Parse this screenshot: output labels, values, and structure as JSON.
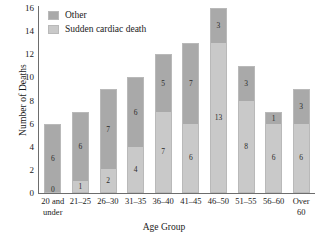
{
  "chart_data": {
    "type": "bar",
    "subtype": "stacked-bar",
    "title": "",
    "xlabel": "Age Group",
    "ylabel": "Number of Deaths",
    "ylim": [
      0,
      16
    ],
    "yticks": [
      0,
      2,
      4,
      6,
      8,
      10,
      12,
      14,
      16
    ],
    "ytick_labels": [
      "0",
      "2",
      "4",
      "6",
      "8",
      "10",
      "12",
      "14",
      "16"
    ],
    "grid": false,
    "legend_position": "top-left-inside",
    "categories": [
      "20 and\nunder",
      "21–25",
      "26–30",
      "31–35",
      "36–40",
      "41–45",
      "46–50",
      "51–55",
      "56–60",
      "Over\n60"
    ],
    "series": [
      {
        "name": "Sudden cardiac death",
        "color": "#c9c9c9",
        "values": [
          0,
          1,
          2,
          4,
          7,
          6,
          13,
          8,
          6,
          6
        ],
        "labels": [
          "0",
          "1",
          "2",
          "4",
          "7",
          "6",
          "13",
          "8",
          "6",
          "6"
        ]
      },
      {
        "name": "Other",
        "color": "#a9a9a9",
        "values": [
          6,
          6,
          7,
          6,
          5,
          7,
          3,
          3,
          1,
          3
        ],
        "labels": [
          "6",
          "6",
          "7",
          "6",
          "5",
          "7",
          "3",
          "3",
          "1",
          "3"
        ]
      }
    ],
    "totals": [
      6,
      7,
      9,
      10,
      12,
      13,
      16,
      11,
      7,
      9
    ]
  },
  "legend": {
    "entries": [
      {
        "label": "Other",
        "color": "#a9a9a9"
      },
      {
        "label": "Sudden cardiac death",
        "color": "#c9c9c9"
      }
    ]
  },
  "axes": {
    "y_title": "Number of Deaths",
    "x_title": "Age Group"
  }
}
